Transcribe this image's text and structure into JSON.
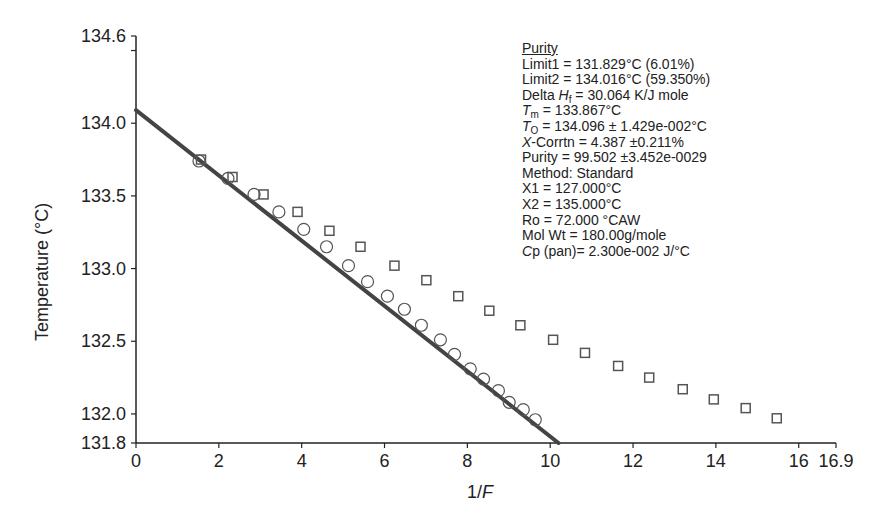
{
  "chart_data": {
    "type": "scatter",
    "title": "",
    "xlabel": "1/F",
    "ylabel": "Temperature (°C)",
    "xlim": [
      0,
      16.9
    ],
    "ylim": [
      131.8,
      134.6
    ],
    "x_ticks": [
      "0",
      "2",
      "4",
      "6",
      "8",
      "10",
      "12",
      "14",
      "16",
      "16.9"
    ],
    "x_tick_values": [
      0,
      2,
      4,
      6,
      8,
      10,
      12,
      14,
      16,
      16.9
    ],
    "y_ticks": [
      "131.8",
      "132.0",
      "132.5",
      "133.0",
      "133.5",
      "134.0",
      "134.6"
    ],
    "y_tick_values": [
      131.8,
      132.0,
      132.5,
      133.0,
      133.5,
      134.0,
      134.6
    ],
    "grid": false,
    "legend": "none",
    "series": [
      {
        "name": "corrected (circles)",
        "marker": "circle",
        "x": [
          1.52,
          2.22,
          2.85,
          3.45,
          4.05,
          4.6,
          5.13,
          5.59,
          6.07,
          6.48,
          6.89,
          7.35,
          7.69,
          8.07,
          8.39,
          8.75,
          9.01,
          9.35,
          9.64
        ],
        "y": [
          133.74,
          133.62,
          133.51,
          133.39,
          133.27,
          133.15,
          133.02,
          132.91,
          132.81,
          132.72,
          132.61,
          132.51,
          132.41,
          132.31,
          132.24,
          132.16,
          132.08,
          132.03,
          131.96
        ]
      },
      {
        "name": "uncorrected (squares)",
        "marker": "square",
        "x": [
          1.57,
          2.33,
          3.08,
          3.9,
          4.67,
          5.42,
          6.24,
          7.01,
          7.78,
          8.53,
          9.28,
          10.07,
          10.84,
          11.64,
          12.39,
          13.2,
          13.95,
          14.72,
          15.47
        ],
        "y": [
          133.75,
          133.63,
          133.51,
          133.39,
          133.26,
          133.15,
          133.02,
          132.92,
          132.81,
          132.71,
          132.61,
          132.51,
          132.42,
          132.33,
          132.25,
          132.17,
          132.1,
          132.04,
          131.97
        ]
      },
      {
        "name": "fit line",
        "marker": "line",
        "x": [
          0,
          10.2
        ],
        "y": [
          134.09,
          131.8
        ]
      }
    ],
    "annotations": [
      "Purity",
      "Limit1 = 131.829°C (6.01%)",
      "Limit2 = 134.016°C (59.350%)",
      "Delta Hf = 30.064 K/J mole",
      "Tm = 133.867°C",
      "To = 134.096 ± 1.429e-002°C",
      "X-Corrtn = 4.387 ±0.211%",
      "Purity = 99.502 ±3.452e-0029",
      "Method: Standard",
      "X1 = 127.000°C",
      "X2 = 135.000°C",
      "Ro = 72.000 °CAW",
      "Mol Wt = 180.00g/mole",
      "Cp (pan)= 2.300e-002 J/°C"
    ]
  },
  "info": {
    "title": "Purity",
    "limit1": "Limit1 = 131.829°C (6.01%)",
    "limit2": "Limit2 = 134.016°C (59.350%)",
    "delta_prefix": "Delta ",
    "delta_sym": "H",
    "delta_sub": "f",
    "delta_rest": " = 30.064 K/J mole",
    "tm_sym": "T",
    "tm_sub": "m",
    "tm_rest": " = 133.867°C",
    "to_sym": "T",
    "to_sub": "O",
    "to_rest": " = 134.096 ± 1.429e-002°C",
    "xc_sym": "X",
    "xc_rest": "-Corrtn = 4.387 ±0.211%",
    "purity": "Purity = 99.502 ±3.452e-0029",
    "method": "Method: Standard",
    "x1": "X1 = 127.000°C",
    "x2": "X2 = 135.000°C",
    "ro": "Ro = 72.000 °CAW",
    "molwt": "Mol Wt = 180.00g/mole",
    "cp_sym": "C",
    "cp_rest": "p (pan)= 2.300e-002 J/°C"
  },
  "colors": {
    "axis": "#222222",
    "fit_line": "#444444",
    "marker": "#555555"
  }
}
